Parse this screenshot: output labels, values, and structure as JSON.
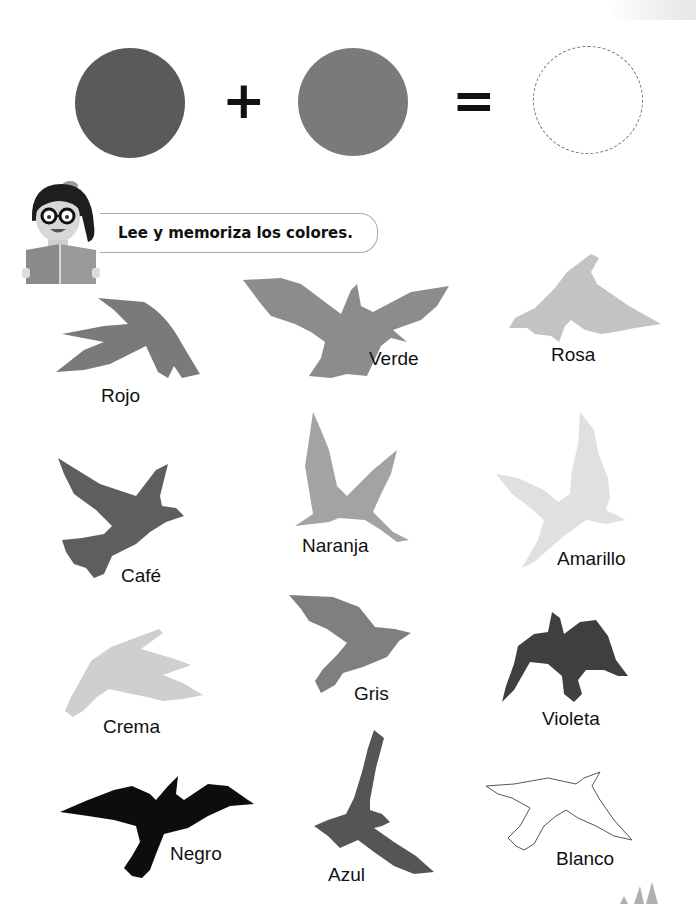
{
  "equation": {
    "circle1_color": "#5a5a5a",
    "plus": "+",
    "circle2_color": "#7a7a7a",
    "equals": "=",
    "result_placeholder": "empty-dashed-circle"
  },
  "instruction": {
    "text": "Lee y memoriza los colores."
  },
  "birds": [
    {
      "label": "Rojo",
      "fill": "#7a7a7a"
    },
    {
      "label": "Verde",
      "fill": "#8c8c8c"
    },
    {
      "label": "Rosa",
      "fill": "#c3c3c3"
    },
    {
      "label": "Café",
      "fill": "#5e5e5e"
    },
    {
      "label": "Naranja",
      "fill": "#a3a3a3"
    },
    {
      "label": "Amarillo",
      "fill": "#e0e0e0"
    },
    {
      "label": "Crema",
      "fill": "#cfcfcf"
    },
    {
      "label": "Gris",
      "fill": "#7f7f7f"
    },
    {
      "label": "Violeta",
      "fill": "#3f3f3f"
    },
    {
      "label": "Negro",
      "fill": "#0d0d0d"
    },
    {
      "label": "Azul",
      "fill": "#555555"
    },
    {
      "label": "Blanco",
      "fill": "#ffffff"
    }
  ]
}
